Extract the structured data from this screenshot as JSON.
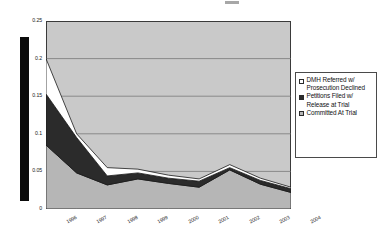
{
  "figure": {
    "background_color": "#ffffff",
    "plot_background_color": "#c9c9c9",
    "marker_bar_label": "black-vertical-bar"
  },
  "legend": {
    "position": "right",
    "entries": [
      {
        "label": "DMH Referred w/ Prosecution Declined",
        "color": "#ffffff",
        "swatch": "sw-white"
      },
      {
        "label": "Petitions Filed w/ Release at Trial",
        "color": "#2b2b2b",
        "swatch": "sw-dark"
      },
      {
        "label": "Committed At Trial",
        "color": "#b6b6b6",
        "swatch": "sw-gray"
      }
    ]
  },
  "axis": {
    "y_ticks": [
      "0.25",
      "0.2",
      "0.15",
      "0.1",
      "0.05",
      "0"
    ],
    "x_ticks": [
      "1996",
      "1997",
      "1998",
      "1999",
      "2000",
      "2001",
      "2002",
      "2003",
      "2004"
    ]
  },
  "chart_data": {
    "type": "area",
    "stacked": true,
    "title": "",
    "subtitle": "",
    "xlabel": "",
    "ylabel": "",
    "xlim": [
      "1996",
      "2004"
    ],
    "ylim": [
      0,
      0.25
    ],
    "ytick_values": [
      0,
      0.05,
      0.1,
      0.15,
      0.2,
      0.25
    ],
    "grid": true,
    "grid_axis": "y",
    "legend_position": "right",
    "categories": [
      "1996",
      "1997",
      "1998",
      "1999",
      "2000",
      "2001",
      "2002",
      "2003",
      "2004"
    ],
    "series": [
      {
        "name": "Committed At Trial",
        "color": "#b6b6b6",
        "values": [
          0.085,
          0.048,
          0.032,
          0.04,
          0.034,
          0.029,
          0.052,
          0.033,
          0.022
        ]
      },
      {
        "name": "Petitions Filed w/ Release at Trial",
        "color": "#2b2b2b",
        "values": [
          0.068,
          0.047,
          0.012,
          0.008,
          0.007,
          0.008,
          0.003,
          0.005,
          0.005
        ]
      },
      {
        "name": "DMH Referred w/ Prosecution Declined",
        "color": "#ffffff",
        "values": [
          0.047,
          0.005,
          0.011,
          0.005,
          0.004,
          0.003,
          0.004,
          0.003,
          0.002
        ]
      }
    ],
    "cumulative_totals": [
      0.2,
      0.1,
      0.055,
      0.053,
      0.045,
      0.04,
      0.059,
      0.041,
      0.029
    ]
  }
}
